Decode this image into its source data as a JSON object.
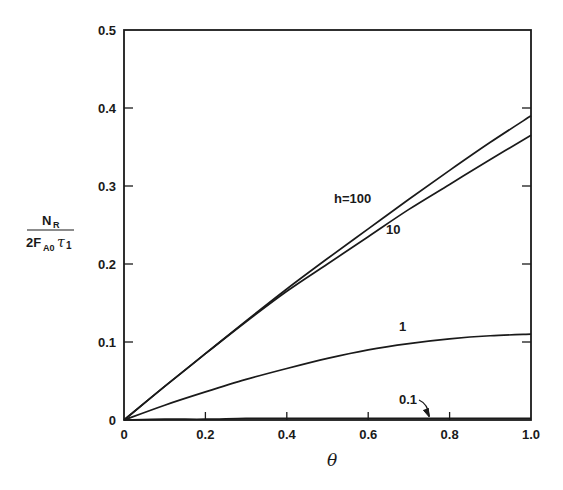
{
  "chart_data": {
    "type": "line",
    "title": "",
    "xlabel": "θ",
    "ylabel": {
      "numerator": "N",
      "numerator_sub": "R",
      "denominator_prefix": "2F",
      "denominator_sub": "A0",
      "denominator_tau": "τ",
      "denominator_tau_sub": "1"
    },
    "xlim": [
      0,
      1.0
    ],
    "ylim": [
      0,
      0.5
    ],
    "xticks": [
      "0",
      "0.2",
      "0.4",
      "0.6",
      "0.8",
      "1.0"
    ],
    "yticks": [
      "0",
      "0.1",
      "0.2",
      "0.3",
      "0.4",
      "0.5"
    ],
    "grid": false,
    "legend": "inline curve labels",
    "x": [
      0,
      0.1,
      0.2,
      0.3,
      0.4,
      0.5,
      0.6,
      0.7,
      0.8,
      0.9,
      1.0
    ],
    "series": [
      {
        "name": "h=100",
        "label": "h=100",
        "values": [
          0,
          0.043,
          0.085,
          0.127,
          0.168,
          0.207,
          0.245,
          0.283,
          0.32,
          0.356,
          0.39
        ]
      },
      {
        "name": "h=10",
        "label": "10",
        "values": [
          0,
          0.043,
          0.085,
          0.126,
          0.165,
          0.2,
          0.235,
          0.27,
          0.302,
          0.334,
          0.365
        ]
      },
      {
        "name": "h=1",
        "label": "1",
        "values": [
          0,
          0.019,
          0.036,
          0.052,
          0.066,
          0.079,
          0.09,
          0.098,
          0.104,
          0.108,
          0.11
        ]
      },
      {
        "name": "h=0.1",
        "label": "0.1",
        "values": [
          0,
          0.001,
          0.001,
          0.002,
          0.002,
          0.002,
          0.002,
          0.002,
          0.002,
          0.002,
          0.002
        ]
      }
    ],
    "annotations": [
      {
        "text": "h=100",
        "near_x": 0.55,
        "near_y": 0.3
      },
      {
        "text": "10",
        "near_x": 0.63,
        "near_y": 0.27
      },
      {
        "text": "1",
        "near_x": 0.66,
        "near_y": 0.12
      },
      {
        "text": "0.1",
        "near_x": 0.67,
        "near_y": 0.02,
        "arrow_to_x": 0.75
      }
    ]
  },
  "colors": {
    "line": "#1a1a1a",
    "background": "#ffffff"
  }
}
